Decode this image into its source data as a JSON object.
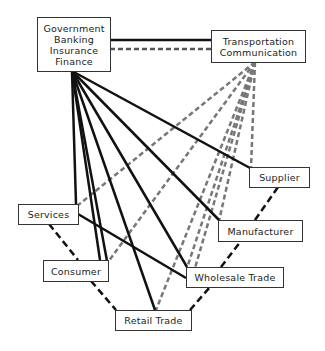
{
  "nodes": {
    "government": {
      "lines": [
        "Government",
        "Banking",
        "Insurance",
        "Finance"
      ]
    },
    "transportation": {
      "lines": [
        "Transportation",
        "Communication"
      ]
    },
    "supplier": {
      "label": "Supplier"
    },
    "manufacturer": {
      "label": "Manufacturer"
    },
    "wholesale": {
      "label": "Wholesale Trade"
    },
    "retail": {
      "label": "Retail Trade"
    },
    "services": {
      "label": "Services"
    },
    "consumer": {
      "label": "Consumer"
    }
  },
  "edges": {
    "solid_from_government": [
      "Supplier",
      "Manufacturer",
      "Wholesale Trade",
      "Retail Trade",
      "Services",
      "Consumer",
      "Transportation Communication"
    ],
    "dashed_from_transportation": [
      "Supplier",
      "Manufacturer",
      "Wholesale Trade",
      "Retail Trade",
      "Services",
      "Consumer",
      "Government Banking Insurance Finance"
    ],
    "solid_other": [
      [
        "Services",
        "Wholesale Trade"
      ]
    ],
    "dashed_chain": [
      "Services",
      "Consumer",
      "Retail Trade",
      "Wholesale Trade",
      "Manufacturer",
      "Supplier"
    ]
  },
  "colors": {
    "solid": "#111111",
    "dashed_gray": "#777777",
    "dashed_black": "#111111"
  }
}
